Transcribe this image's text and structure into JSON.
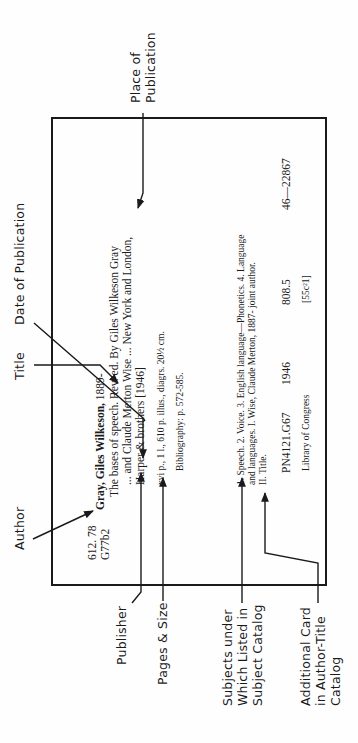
{
  "labels": {
    "author": "Author",
    "title": "Title",
    "date_of_publication": "Date of Publication",
    "place_of_publication": [
      "Place of",
      "Publication"
    ],
    "publisher": "Publisher",
    "pages_and_size": "Pages & Size",
    "subjects": [
      "Subjects under",
      "Which Listed in",
      "Subject Catalog"
    ],
    "additional_card": [
      "Additional Card",
      "in Author-Title",
      "Catalog"
    ]
  },
  "card": {
    "call_number": [
      "612. 78",
      "G77b2"
    ],
    "author_heading": "Gray, Giles Wilkeson,",
    "author_dates": "1889-",
    "title_line": "The bases of speech.  Rev. ed.  By Giles Wilkeson Gray",
    "title_line2": "... and Claude Merton Wise ...  New York and London,",
    "publisher_line": "Harper & brothers [1946]",
    "collation": "xvi p., 1 l., 610 p.  illus., diagrs.  20½ cm.",
    "bibliography": "Bibliography: p. 572-585.",
    "tracings_line1": "1. Speech.  2. Voice.  3. English language—Phonetics.  4. Language",
    "tracings_line2": "and languages.    I. Wise, Claude Merton, 1887-     joint author.",
    "tracings_line3": "II. Title.",
    "lc_class": "PN4121.G67",
    "lc_year": "1946",
    "dewey": "808.5",
    "card_number": "46—22867",
    "library": "Library of Congress",
    "print_key": "[55c²1]"
  }
}
